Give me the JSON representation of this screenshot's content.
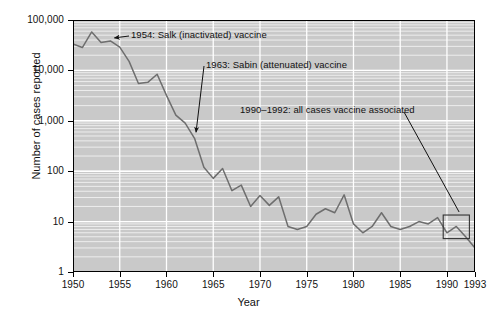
{
  "chart_data": {
    "type": "line",
    "title": "",
    "xlabel": "Year",
    "ylabel": "Number of cases reported",
    "yscale": "log",
    "ylim": [
      1,
      100000
    ],
    "xlim": [
      1950,
      1993
    ],
    "grid": true,
    "legend_position": "none",
    "ytick_labels": [
      "1",
      "10",
      "100",
      "1,000",
      "10,000",
      "100,000"
    ],
    "ytick_values": [
      1,
      10,
      100,
      1000,
      10000,
      100000
    ],
    "xtick_labels": [
      "1950",
      "1955",
      "1960",
      "1965",
      "1970",
      "1975",
      "1980",
      "1985",
      "1990",
      "1993"
    ],
    "xtick_values": [
      1950,
      1955,
      1960,
      1965,
      1970,
      1975,
      1980,
      1985,
      1990,
      1993
    ],
    "series": [
      {
        "name": "Poliomyelitis cases reported",
        "x": [
          1950,
          1951,
          1952,
          1953,
          1954,
          1955,
          1956,
          1957,
          1958,
          1959,
          1960,
          1961,
          1962,
          1963,
          1964,
          1965,
          1966,
          1967,
          1968,
          1969,
          1970,
          1971,
          1972,
          1973,
          1974,
          1975,
          1976,
          1977,
          1978,
          1979,
          1980,
          1981,
          1982,
          1983,
          1984,
          1985,
          1986,
          1987,
          1988,
          1989,
          1990,
          1991,
          1992,
          1993
        ],
        "values": [
          33300,
          28400,
          57900,
          35600,
          38500,
          28900,
          15100,
          5500,
          5800,
          8400,
          3200,
          1300,
          900,
          450,
          120,
          72,
          113,
          41,
          53,
          20,
          33,
          21,
          31,
          8,
          7,
          8,
          14,
          18,
          15,
          34,
          9,
          6,
          8,
          15,
          8,
          7,
          8,
          10,
          9,
          12,
          6,
          8,
          5,
          3
        ]
      }
    ],
    "annotations": [
      {
        "name": "salk",
        "text": "1954: Salk (inactivated) vaccine",
        "points_to_year": 1954,
        "points_to_value": 38500
      },
      {
        "name": "sabin",
        "text": "1963: Sabin (attenuated) vaccine",
        "points_to_year": 1963,
        "points_to_value": 450
      },
      {
        "name": "vaccine-associated",
        "text": "1990–1992: all cases vaccine associated",
        "points_to_year": 1991,
        "points_to_value": 8
      }
    ],
    "highlight_box": {
      "x_start": 1989.6,
      "x_end": 1992.4,
      "y_low": 4.6,
      "y_high": 13.5
    }
  },
  "colors": {
    "plot_background": "#c9c9c9",
    "gridline": "#ffffff",
    "line": "#6e6e6e",
    "axis": "#000000",
    "text": "#111111"
  }
}
